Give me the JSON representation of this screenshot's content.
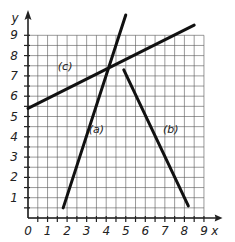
{
  "chart_data": {
    "type": "line",
    "title": "",
    "xlabel": "x",
    "ylabel": "y",
    "xlim": [
      0,
      9
    ],
    "ylim": [
      0,
      9
    ],
    "x_ticks": [
      "0",
      "1",
      "2",
      "3",
      "4",
      "5",
      "6",
      "7",
      "8",
      "9"
    ],
    "y_ticks": [
      "1",
      "2",
      "3",
      "4",
      "5",
      "6",
      "7",
      "8",
      "9"
    ],
    "grid": true,
    "grid_step": 0.5,
    "series": [
      {
        "name": "(a)",
        "points": [
          [
            1.8,
            0.5
          ],
          [
            5.0,
            10.0
          ]
        ]
      },
      {
        "name": "(b)",
        "points": [
          [
            4.9,
            7.3
          ],
          [
            8.2,
            0.6
          ]
        ]
      },
      {
        "name": "(c)",
        "points": [
          [
            0.0,
            5.4
          ],
          [
            8.5,
            9.5
          ]
        ]
      }
    ],
    "annotations": [
      {
        "text": "(a)",
        "x": 3.5,
        "y": 4.2
      },
      {
        "text": "(b)",
        "x": 7.3,
        "y": 4.2
      },
      {
        "text": "(c)",
        "x": 1.9,
        "y": 7.3
      }
    ],
    "legend": "none"
  },
  "colors": {
    "line": "#111111",
    "grid": "#555555",
    "axis": "#222222"
  }
}
